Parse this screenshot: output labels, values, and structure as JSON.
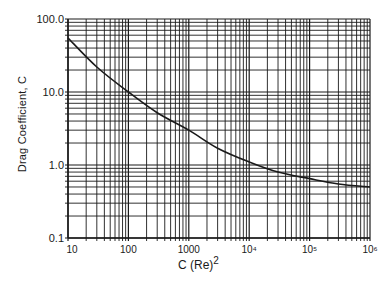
{
  "chart_data": {
    "type": "line",
    "title": "",
    "xlabel": "C (Re)",
    "xlabel_superscript": "2",
    "ylabel": "Drag Coefficient, C",
    "xscale": "log",
    "yscale": "log",
    "xlim": [
      10,
      1000000
    ],
    "ylim": [
      0.1,
      100.0
    ],
    "x_tick_labels": [
      "10",
      "100",
      "1000",
      "10⁴",
      "10⁵",
      "10⁶"
    ],
    "y_tick_labels": [
      "0.1",
      "1.0",
      "10.0",
      "100.0"
    ],
    "grid": true,
    "legend": null,
    "series": [
      {
        "name": "Drag coefficient curve",
        "x": [
          10,
          30,
          100,
          300,
          1000,
          3000,
          10000,
          30000,
          100000,
          300000,
          1000000
        ],
        "values": [
          55,
          22,
          10,
          5.2,
          3.0,
          1.7,
          1.1,
          0.8,
          0.65,
          0.55,
          0.5
        ]
      }
    ],
    "color": "#1a1a1a"
  }
}
